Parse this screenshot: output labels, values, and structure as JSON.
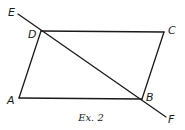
{
  "diagram": {
    "type": "geometry",
    "caption": "Ex. 2",
    "shape": "parallelogram ABCD with transversal line EF through D and B",
    "points": {
      "A": {
        "label": "A",
        "x": 19,
        "y": 98
      },
      "B": {
        "label": "B",
        "x": 142,
        "y": 99
      },
      "C": {
        "label": "C",
        "x": 164,
        "y": 32
      },
      "D": {
        "label": "D",
        "x": 41,
        "y": 31
      },
      "E": {
        "label": "E",
        "x": 18,
        "y": 14
      },
      "F": {
        "label": "F",
        "x": 166,
        "y": 117
      }
    },
    "labels": {
      "A": "A",
      "B": "B",
      "C": "C",
      "D": "D",
      "E": "E",
      "F": "F"
    },
    "segments": [
      {
        "from": "A",
        "to": "B"
      },
      {
        "from": "B",
        "to": "C"
      },
      {
        "from": "C",
        "to": "D"
      },
      {
        "from": "D",
        "to": "A"
      },
      {
        "from": "E",
        "to": "F"
      }
    ],
    "colors": {
      "stroke": "#1a1a1a",
      "background": "#ffffff"
    }
  }
}
